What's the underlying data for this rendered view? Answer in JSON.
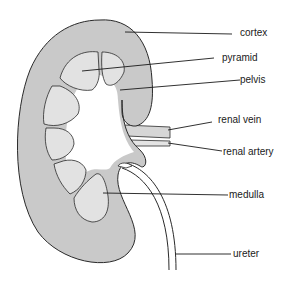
{
  "diagram": {
    "colors": {
      "cortex": "#c9c9c9",
      "medulla": "#e2e2e2",
      "outline": "#2a2a2a",
      "vessel": "#d6d6d6",
      "background": "#ffffff"
    },
    "labels": [
      {
        "id": "cortex",
        "text": "cortex"
      },
      {
        "id": "pyramid",
        "text": "pyramid"
      },
      {
        "id": "pelvis",
        "text": "pelvis"
      },
      {
        "id": "renal-vein",
        "text": "renal vein"
      },
      {
        "id": "renal-artery",
        "text": "renal artery"
      },
      {
        "id": "medulla",
        "text": "medulla"
      },
      {
        "id": "ureter",
        "text": "ureter"
      }
    ]
  }
}
